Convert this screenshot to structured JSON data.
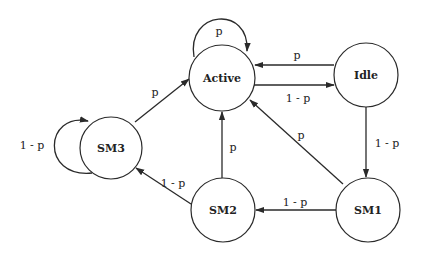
{
  "diagram": {
    "type": "state-transition",
    "nodes": [
      {
        "id": "active",
        "label": "Active",
        "cx": 222,
        "cy": 78,
        "r": 33
      },
      {
        "id": "idle",
        "label": "Idle",
        "cx": 366,
        "cy": 75,
        "r": 32
      },
      {
        "id": "sm3",
        "label": "SM3",
        "cx": 111,
        "cy": 148,
        "r": 31
      },
      {
        "id": "sm2",
        "label": "SM2",
        "cx": 223,
        "cy": 210,
        "r": 32
      },
      {
        "id": "sm1",
        "label": "SM1",
        "cx": 368,
        "cy": 210,
        "r": 32
      }
    ],
    "edges": [
      {
        "from": "active",
        "to": "active",
        "label": "p"
      },
      {
        "from": "idle",
        "to": "active",
        "label": "p"
      },
      {
        "from": "active",
        "to": "idle",
        "label": "1 - p"
      },
      {
        "from": "idle",
        "to": "sm1",
        "label": "1 - p"
      },
      {
        "from": "sm1",
        "to": "active",
        "label": "p"
      },
      {
        "from": "sm1",
        "to": "sm2",
        "label": "1 - p"
      },
      {
        "from": "sm2",
        "to": "active",
        "label": "p"
      },
      {
        "from": "sm2",
        "to": "sm3",
        "label": "1 - p"
      },
      {
        "from": "sm3",
        "to": "active",
        "label": "p"
      },
      {
        "from": "sm3",
        "to": "sm3",
        "label": "1 - p"
      }
    ]
  }
}
